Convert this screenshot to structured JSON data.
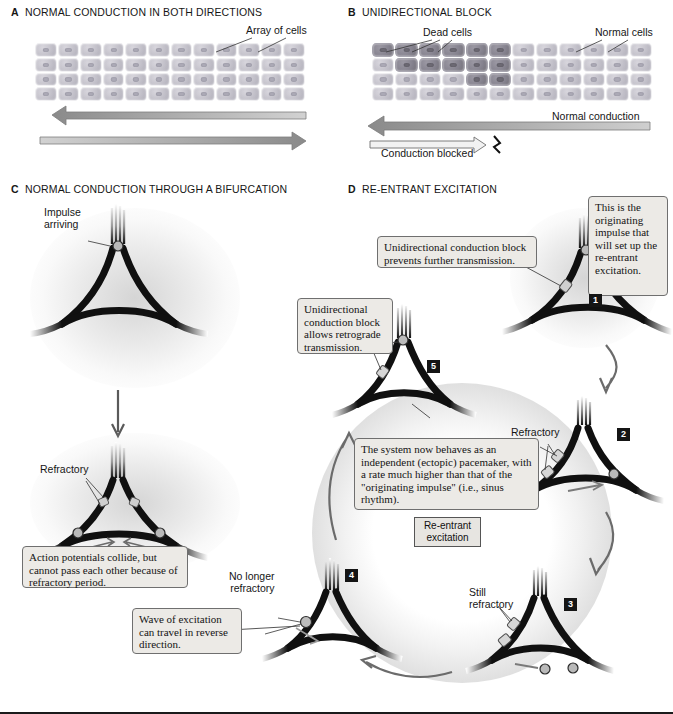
{
  "figure": {
    "panels": [
      {
        "letter": "A",
        "title": "NORMAL CONDUCTION IN BOTH DIRECTIONS"
      },
      {
        "letter": "B",
        "title": "UNIDIRECTIONAL BLOCK"
      },
      {
        "letter": "C",
        "title": "NORMAL CONDUCTION THROUGH A BIFURCATION"
      },
      {
        "letter": "D",
        "title": "RE-ENTRANT EXCITATION"
      }
    ]
  },
  "panelA": {
    "label_array_of_cells": "Array of cells",
    "arrow_left_name": "leftward-conduction-arrow",
    "arrow_right_name": "rightward-conduction-arrow"
  },
  "panelB": {
    "label_dead_cells": "Dead cells",
    "label_normal_cells": "Normal cells",
    "label_normal_conduction": "Normal conduction",
    "label_conduction_blocked": "Conduction blocked"
  },
  "panelC": {
    "label_impulse_arriving": "Impulse\narriving",
    "label_impulse_line1": "Impulse",
    "label_impulse_line2": "arriving",
    "label_refractory": "Refractory",
    "callout_collide": "Action potentials collide, but cannot pass each other because of refractory period."
  },
  "panelD": {
    "callout_originating": "This is the originating impulse that will set up the re-entrant excitation.",
    "callout_block_prevents": "Unidirectional conduction block prevents further transmission.",
    "callout_block_allows": "Unidirectional conduction block allows retrograde transmission.",
    "callout_system": "The system now behaves as an independent (ectopic) pacemaker, with a rate much higher than that of the \"originating impulse\" (i.e., sinus rhythm).",
    "callout_wave": "Wave of excitation can travel in reverse direction.",
    "tag_reentrant_line1": "Re-entrant",
    "tag_reentrant_line2": "excitation",
    "label_refractory": "Refractory",
    "label_still_refractory_line1": "Still",
    "label_still_refractory_line2": "refractory",
    "label_no_longer_refractory_line1": "No longer",
    "label_no_longer_refractory_line2": "refractory",
    "steps": [
      "1",
      "2",
      "3",
      "4",
      "5"
    ]
  },
  "colors": {
    "callout_bg": "#eceae6",
    "callout_border": "#6f6f6f",
    "cell_normal": "#c3c1ca",
    "cell_dead": "#86838f",
    "arrow_gray": "#8d8d8d",
    "fiber_dark": "#101010",
    "badge_bg": "#151515"
  }
}
